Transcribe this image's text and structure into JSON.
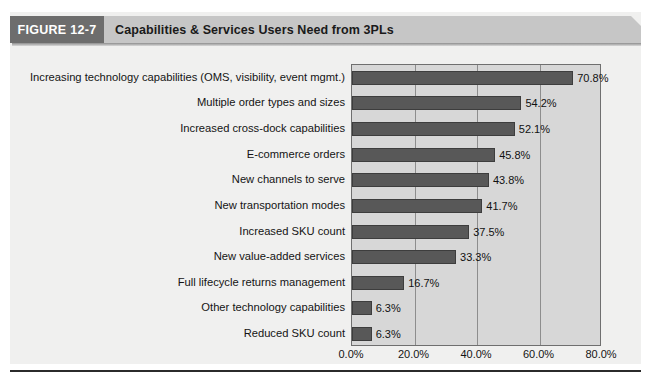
{
  "figure": {
    "tag_label": "FIGURE 12-7",
    "title": "Capabilities & Services Users Need from 3PLs"
  },
  "colors": {
    "banner_tag_bg": "#6d6d6d",
    "banner_bg": "#c6c6c6",
    "plot_bg": "#d7d7d7",
    "bar_fill": "#585858",
    "gridline": "#8d8d8d",
    "axis_border": "#6f6f6f"
  },
  "chart_data": {
    "type": "bar",
    "orientation": "horizontal",
    "title": "Capabilities & Services Users Need from 3PLs",
    "xlabel": "",
    "ylabel": "",
    "xlim": [
      0,
      80
    ],
    "grid": true,
    "legend": "none",
    "xticks": [
      "0.0%",
      "20.0%",
      "40.0%",
      "60.0%",
      "80.0%"
    ],
    "xtick_values": [
      0,
      20,
      40,
      60,
      80
    ],
    "categories": [
      "Increasing technology capabilities (OMS, visibility, event mgmt.)",
      "Multiple order types and sizes",
      "Increased cross-dock capabilities",
      "E-commerce orders",
      "New channels to serve",
      "New transportation modes",
      "Increased SKU count",
      "New value-added services",
      "Full lifecycle returns management",
      "Other technology capabilities",
      "Reduced SKU count"
    ],
    "values": [
      70.8,
      54.2,
      52.1,
      45.8,
      43.8,
      41.7,
      37.5,
      33.3,
      16.7,
      6.3,
      6.3
    ],
    "value_labels": [
      "70.8%",
      "54.2%",
      "52.1%",
      "45.8%",
      "43.8%",
      "41.7%",
      "37.5%",
      "33.3%",
      "16.7%",
      "6.3%",
      "6.3%"
    ]
  }
}
